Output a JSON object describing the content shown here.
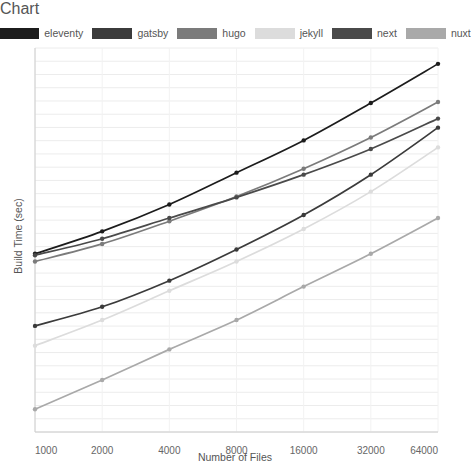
{
  "chart_data": {
    "type": "line",
    "title": "",
    "xlabel": "Number of Files",
    "ylabel": "Build Time (sec)",
    "x_scale": "log2",
    "x": [
      1000,
      2000,
      4000,
      8000,
      16000,
      32000,
      64000
    ],
    "x_tick_labels": [
      "1000",
      "2000",
      "4000",
      "8000",
      "16000",
      "32000",
      "64000"
    ],
    "y_tick_labels": [],
    "ylim": [
      0,
      100
    ],
    "grid": true,
    "grid_axis": "y",
    "legend_position": "top",
    "series": [
      {
        "name": "eleventy",
        "color": "#1c1c1c",
        "values": [
          6.9,
          8.6,
          11.2,
          15.3,
          21.0,
          30.3,
          44.5
        ]
      },
      {
        "name": "gatsby",
        "color": "#3b3b3b",
        "values": [
          3.4,
          4.1,
          5.3,
          7.2,
          10.1,
          15.0,
          23.8
        ]
      },
      {
        "name": "hugo",
        "color": "#7b7b7b",
        "values": [
          6.4,
          7.6,
          9.5,
          12.1,
          15.9,
          21.6,
          30.6
        ]
      },
      {
        "name": "jekyll",
        "color": "#dcdcdc",
        "values": [
          2.8,
          3.6,
          4.8,
          6.4,
          8.8,
          12.7,
          19.6
        ]
      },
      {
        "name": "next",
        "color": "#4a4a4a",
        "values": [
          6.8,
          8.0,
          9.8,
          12.0,
          15.0,
          19.3,
          26.0
        ]
      },
      {
        "name": "nuxt",
        "color": "#a9a9a9",
        "values": [
          1.5,
          2.0,
          2.7,
          3.6,
          5.0,
          6.9,
          9.8
        ]
      }
    ]
  },
  "legend": {
    "items": [
      {
        "label": "eleventy",
        "color": "#1c1c1c"
      },
      {
        "label": "gatsby",
        "color": "#3b3b3b"
      },
      {
        "label": "hugo",
        "color": "#7b7b7b"
      },
      {
        "label": "jekyll",
        "color": "#dcdcdc"
      },
      {
        "label": "next",
        "color": "#4a4a4a"
      },
      {
        "label": "nuxt",
        "color": "#a9a9a9"
      }
    ]
  },
  "axes": {
    "x_title": "Number of Files",
    "y_title": "Build Time (sec)"
  },
  "style": {
    "grid_color": "#ececec",
    "axis_color": "#cccccc",
    "background": "#ffffff"
  }
}
